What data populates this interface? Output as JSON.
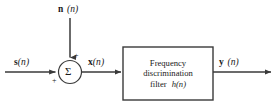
{
  "diagram": {
    "background_color": "#ffffff",
    "line_color": "#3a3a3a",
    "text_color": "#1a1a1a"
  },
  "signals": {
    "noise_input": {
      "symbol": "n",
      "index": "(n)",
      "label": "n (n)"
    },
    "signal_input": {
      "symbol": "s",
      "index": "(n)",
      "label": "s (n)"
    },
    "sum_output": {
      "symbol": "x",
      "index": "(n)",
      "label": "x(n)"
    },
    "filter_output": {
      "symbol": "y",
      "index": "(n)",
      "label": "y (n)"
    }
  },
  "summing_junction": {
    "glyph": "Σ",
    "name": "summing-junction",
    "noise_sign": "+",
    "signal_sign": "+"
  },
  "filter_block": {
    "line1": "Frequency",
    "line2": "discrimination",
    "line3_prefix": "filter",
    "line3_symbol": "h",
    "line3_index": "(n)"
  }
}
